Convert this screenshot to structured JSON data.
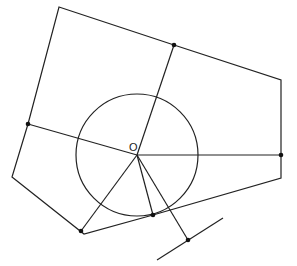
{
  "diagram": {
    "type": "geometry",
    "center_label": "O",
    "circle": {
      "cx": 137,
      "cy": 155,
      "r": 61
    },
    "polygon": [
      [
        59,
        7
      ],
      [
        174,
        45
      ],
      [
        281,
        80
      ],
      [
        281,
        178
      ],
      [
        153,
        215
      ],
      [
        84,
        234
      ],
      [
        12,
        177
      ],
      [
        28,
        124
      ]
    ],
    "points": [
      {
        "name": "top-point",
        "x": 174,
        "y": 45
      },
      {
        "name": "left-point",
        "x": 28,
        "y": 124
      },
      {
        "name": "right-point",
        "x": 281,
        "y": 155
      },
      {
        "name": "bottom-left-point",
        "x": 81,
        "y": 231
      },
      {
        "name": "bottom-point",
        "x": 153,
        "y": 215
      },
      {
        "name": "tangent-point",
        "x": 188,
        "y": 240
      }
    ],
    "segments_from_center": [
      {
        "name": "radius-to-top",
        "to": [
          174,
          45
        ]
      },
      {
        "name": "radius-to-left",
        "to": [
          28,
          124
        ]
      },
      {
        "name": "radius-to-right",
        "to": [
          281,
          155
        ]
      },
      {
        "name": "radius-to-bottom-left",
        "to": [
          81,
          231
        ]
      },
      {
        "name": "radius-to-bottom",
        "to": [
          153,
          215
        ]
      },
      {
        "name": "radius-to-tangent",
        "to": [
          188,
          240
        ]
      }
    ],
    "tangent_line": {
      "from": [
        157,
        260
      ],
      "to": [
        223,
        218
      ]
    }
  }
}
